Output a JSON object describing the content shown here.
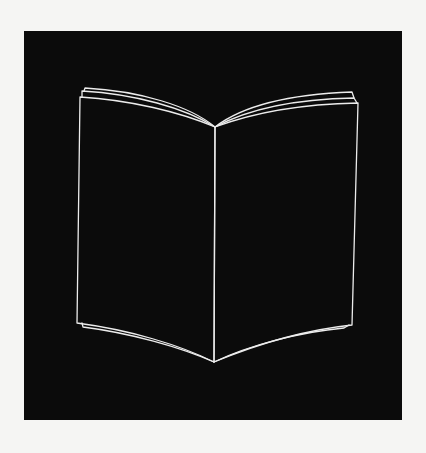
{
  "illustration": {
    "subject": "open-book",
    "style": "white line art on black square",
    "colors": {
      "background": "#f5f5f3",
      "panel": "#0b0b0b",
      "stroke": "#ececec"
    }
  }
}
